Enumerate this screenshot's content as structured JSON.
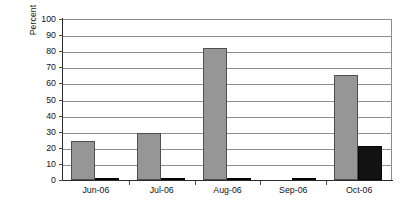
{
  "chart_data": {
    "type": "bar",
    "title": "",
    "subtitle": "",
    "xlabel": "",
    "ylabel": "Percent",
    "categories": [
      "Jun-06",
      "Jul-06",
      "Aug-06",
      "Sep-06",
      "Oct-06"
    ],
    "series": [
      {
        "name": "series-gray",
        "color": "#969696",
        "values": [
          24,
          29,
          82,
          0,
          65
        ]
      },
      {
        "name": "series-black",
        "color": "#121212",
        "values": [
          1,
          1,
          1,
          1,
          21
        ]
      }
    ],
    "ylim": [
      0,
      100
    ],
    "yticks": [
      0,
      10,
      20,
      30,
      40,
      50,
      60,
      70,
      80,
      90,
      100
    ],
    "ytick_labels": [
      "0",
      "10",
      "20",
      "30",
      "40",
      "50",
      "60",
      "70",
      "80",
      "90",
      "100"
    ],
    "grid": true,
    "grid_axis": "y",
    "legend": "none",
    "legend_position": "none",
    "annotations": []
  },
  "axes": {
    "y_title": "Percent"
  }
}
